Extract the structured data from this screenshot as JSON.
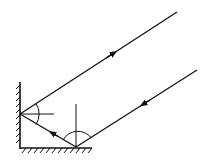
{
  "diagram": {
    "colors": {
      "line": "#111111",
      "background": "#ffffff"
    },
    "mirrors": {
      "vertical": {
        "x": 20,
        "y1": 82,
        "y2": 148
      },
      "horizontal": {
        "y": 148,
        "x1": 20,
        "x2": 92
      }
    },
    "points": {
      "A": {
        "x": 20,
        "y": 114,
        "label": ""
      },
      "B": {
        "x": 76,
        "y": 147,
        "label": ""
      }
    },
    "rays": [
      {
        "name": "incident",
        "from": [
          197,
          70
        ],
        "to": [
          76,
          147
        ],
        "arrow": "toward-mirror"
      },
      {
        "name": "intermediate",
        "from": [
          76,
          147
        ],
        "to": [
          20,
          114
        ],
        "arrow": "toward-vertical-mirror"
      },
      {
        "name": "emergent",
        "from": [
          20,
          114
        ],
        "to": [
          177,
          12
        ],
        "arrow": "away-from-mirror"
      }
    ],
    "normals": [
      {
        "at": "A",
        "orientation": "horizontal",
        "length": 34
      },
      {
        "at": "B",
        "orientation": "vertical",
        "length": 43
      }
    ],
    "angle_arcs": [
      {
        "at": "A",
        "between": [
          "normal",
          "emergent-ray"
        ]
      },
      {
        "at": "B",
        "between": [
          "intermediate-ray",
          "incident-ray"
        ]
      }
    ]
  }
}
